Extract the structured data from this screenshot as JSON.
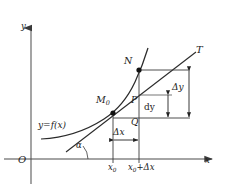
{
  "figure": {
    "kind": "calculus-differential-diagram",
    "stray_text_above": "x₀),",
    "axes": {
      "y_axis_label": "y",
      "x_axis_label": "x",
      "origin_label": "O"
    },
    "curve": {
      "label": "y=f(x)",
      "tangent_label": "T",
      "angle_label": "α"
    },
    "points": {
      "m0": "M",
      "m0_sub": "0",
      "n": "N",
      "p": "P",
      "q": "Q"
    },
    "measures": {
      "delta_x": "Δx",
      "delta_y": "Δy",
      "dy": "dy"
    },
    "ticks": {
      "x0_main": "x",
      "x0_sub": "0",
      "x0_plus_dx_main": "x",
      "x0_plus_dx_sub": "0",
      "x0_plus_dx_tail": "+Δx"
    },
    "colors": {
      "ink": "#1a1a1a",
      "axis": "#555555",
      "background": "#ffffff"
    }
  }
}
